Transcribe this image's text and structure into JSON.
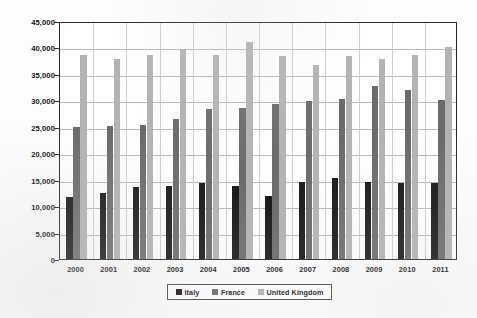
{
  "chart_data": {
    "type": "bar",
    "title": "",
    "subtitle": "",
    "xlabel": "",
    "ylabel": "",
    "categories": [
      "2000",
      "2001",
      "2002",
      "2003",
      "2004",
      "2005",
      "2006",
      "2007",
      "2008",
      "2009",
      "2010",
      "2011"
    ],
    "series": [
      {
        "name": "Italy",
        "color": "#171717",
        "values": [
          11800,
          12500,
          13700,
          13800,
          14300,
          13800,
          11900,
          14600,
          15300,
          14500,
          14400,
          14300
        ]
      },
      {
        "name": "France",
        "color": "#6b6b6b",
        "values": [
          25000,
          25100,
          25400,
          26500,
          28300,
          28500,
          29400,
          29900,
          30200,
          32800,
          32000,
          30100
        ]
      },
      {
        "name": "United Kingdom",
        "color": "#b3b3b3",
        "values": [
          38500,
          37800,
          38500,
          39800,
          38500,
          41000,
          38400,
          36600,
          38400,
          37900,
          38500,
          40000
        ]
      }
    ],
    "ylim": [
      0,
      45000
    ],
    "ytick_values": [
      0,
      5000,
      10000,
      15000,
      20000,
      25000,
      30000,
      35000,
      40000,
      45000
    ],
    "ytick_labels": [
      "0",
      "5,000",
      "10,000",
      "15,000",
      "20,000",
      "25,000",
      "30,000",
      "35,000",
      "40,000",
      "45,000"
    ],
    "grid": true,
    "grid_axis": "both",
    "legend_position": "bottom-center",
    "legend_entries": [
      "Italy",
      "France",
      "United Kingdom"
    ],
    "plot_background": "#ffffff",
    "figure_background": "#fdfdfd",
    "axis_color": "#2a2a2a",
    "gridline_color": "#b9b9b9"
  }
}
